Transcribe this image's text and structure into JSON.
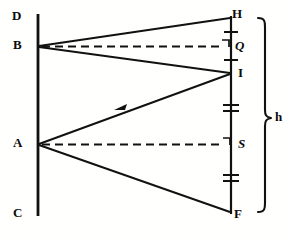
{
  "figure": {
    "canvas": {
      "width": 290,
      "height": 242
    },
    "ink_color": "#111111",
    "background_color": "#ffffff"
  },
  "labels": {
    "D": "D",
    "B": "B",
    "A": "A",
    "C": "C",
    "H": "H",
    "Q": "Q",
    "I": "I",
    "S": "S",
    "F": "F",
    "h": "h"
  },
  "points": {
    "D": {
      "x": 21,
      "y": 18,
      "label": "D"
    },
    "B": {
      "x": 38,
      "y": 46,
      "label": "B"
    },
    "A": {
      "x": 38,
      "y": 144,
      "label": "A"
    },
    "C": {
      "x": 21,
      "y": 214,
      "label": "C"
    },
    "H": {
      "x": 231,
      "y": 18,
      "label": "H"
    },
    "Q": {
      "x": 231,
      "y": 46,
      "label": "Q"
    },
    "I": {
      "x": 231,
      "y": 73,
      "label": "I"
    },
    "S": {
      "x": 231,
      "y": 144,
      "label": "S"
    },
    "F": {
      "x": 231,
      "y": 212,
      "label": "F"
    }
  },
  "lines": {
    "left_vertical": {
      "name": "mirror-line-DC",
      "x": 38,
      "y1": 14,
      "y2": 216,
      "style": "solid",
      "width": 2.6
    },
    "right_vertical": {
      "name": "object-line-HF",
      "x": 231,
      "y1": 16,
      "y2": 214,
      "style": "solid",
      "width": 2.2
    }
  },
  "rays": [
    {
      "name": "ray-B-to-H",
      "from": "B",
      "to": "H",
      "style": "solid"
    },
    {
      "name": "ray-B-to-I",
      "from": "B",
      "to": "I",
      "style": "solid"
    },
    {
      "name": "ray-A-to-I",
      "from": "A",
      "to": "I",
      "style": "solid",
      "arrow": "toward-A",
      "arrow_at": {
        "x": 122,
        "y": 108
      }
    },
    {
      "name": "ray-A-to-F",
      "from": "A",
      "to": "F",
      "style": "solid"
    }
  ],
  "dashed_lines": [
    {
      "name": "axis-B-to-Q",
      "from": "B",
      "to": "Q",
      "style": "dashed"
    },
    {
      "name": "axis-A-to-S",
      "from": "A",
      "to": "S",
      "style": "dashed"
    }
  ],
  "right_angle_marks": [
    {
      "name": "right-angle-at-Q",
      "x": 231,
      "y": 46
    },
    {
      "name": "right-angle-at-S",
      "x": 231,
      "y": 144
    }
  ],
  "tick_marks": [
    {
      "name": "tick-HQ",
      "x": 231,
      "y": 32,
      "count": 1,
      "segment": "HQ"
    },
    {
      "name": "tick-QI",
      "x": 231,
      "y": 60,
      "count": 1,
      "segment": "QI"
    },
    {
      "name": "tick-I-S-upper",
      "x": 231,
      "y": 108,
      "count": 2,
      "segment": "IS"
    },
    {
      "name": "tick-S-F-lower",
      "x": 231,
      "y": 178,
      "count": 2,
      "segment": "SF"
    }
  ],
  "brace": {
    "name": "height-brace-h",
    "label": "h",
    "x": 262,
    "y_top": 18,
    "y_bottom": 212,
    "y_mid": 118,
    "spans": "H to F"
  }
}
